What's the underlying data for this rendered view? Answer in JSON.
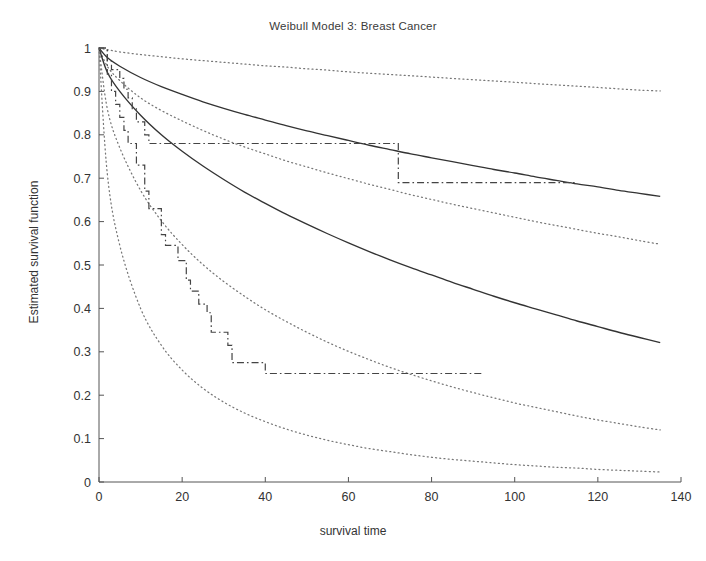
{
  "chart_data": {
    "type": "line",
    "title": "Weibull Model 3: Breast Cancer",
    "xlabel": "survival time",
    "ylabel": "Estimated survival function",
    "xlim": [
      0,
      140
    ],
    "ylim": [
      0,
      1
    ],
    "xticks": [
      0,
      20,
      40,
      60,
      80,
      100,
      120,
      140
    ],
    "yticks": [
      0,
      0.1,
      0.2,
      0.3,
      0.4,
      0.5,
      0.6,
      0.7,
      0.8,
      0.9,
      1
    ],
    "grid": false,
    "legend": "none",
    "colors": {
      "line": "#333333",
      "band": "#777777",
      "km": "#444444",
      "axis": "#555555"
    },
    "series": [
      {
        "name": "Fitted Weibull survival - group 1 (negative staining)",
        "style": "solid",
        "x": [
          0,
          2,
          5,
          10,
          15,
          20,
          25,
          30,
          35,
          40,
          45,
          50,
          55,
          60,
          65,
          70,
          75,
          80,
          85,
          90,
          95,
          100,
          105,
          110,
          115,
          120,
          125,
          130,
          135
        ],
        "y": [
          1.0,
          0.978,
          0.958,
          0.932,
          0.911,
          0.893,
          0.876,
          0.861,
          0.847,
          0.834,
          0.821,
          0.809,
          0.798,
          0.787,
          0.776,
          0.766,
          0.756,
          0.747,
          0.738,
          0.729,
          0.72,
          0.712,
          0.703,
          0.695,
          0.687,
          0.68,
          0.672,
          0.665,
          0.658
        ]
      },
      {
        "name": "Upper 95% confidence band - group 1",
        "style": "dotted",
        "x": [
          0,
          2,
          5,
          10,
          15,
          20,
          25,
          30,
          35,
          40,
          45,
          50,
          55,
          60,
          65,
          70,
          75,
          80,
          85,
          90,
          95,
          100,
          105,
          110,
          115,
          120,
          125,
          130,
          135
        ],
        "y": [
          1.0,
          0.996,
          0.991,
          0.985,
          0.98,
          0.975,
          0.971,
          0.967,
          0.963,
          0.959,
          0.956,
          0.952,
          0.949,
          0.945,
          0.942,
          0.939,
          0.936,
          0.933,
          0.93,
          0.927,
          0.924,
          0.921,
          0.918,
          0.915,
          0.912,
          0.909,
          0.906,
          0.903,
          0.901
        ]
      },
      {
        "name": "Lower 95% confidence band - group 1",
        "style": "dotted",
        "x": [
          0,
          2,
          5,
          10,
          15,
          20,
          25,
          30,
          35,
          40,
          45,
          50,
          55,
          60,
          65,
          70,
          75,
          80,
          85,
          90,
          95,
          100,
          105,
          110,
          115,
          120,
          125,
          130,
          135
        ],
        "y": [
          1.0,
          0.958,
          0.925,
          0.885,
          0.856,
          0.832,
          0.81,
          0.79,
          0.772,
          0.756,
          0.74,
          0.726,
          0.712,
          0.699,
          0.686,
          0.674,
          0.662,
          0.651,
          0.64,
          0.63,
          0.62,
          0.61,
          0.6,
          0.591,
          0.582,
          0.573,
          0.565,
          0.556,
          0.548
        ]
      },
      {
        "name": "Fitted Weibull survival - group 2 (positive staining)",
        "style": "solid",
        "x": [
          0,
          2,
          5,
          10,
          15,
          20,
          25,
          30,
          35,
          40,
          45,
          50,
          55,
          60,
          65,
          70,
          75,
          80,
          85,
          90,
          95,
          100,
          105,
          110,
          115,
          120,
          125,
          130,
          135
        ],
        "y": [
          1.0,
          0.944,
          0.9,
          0.845,
          0.8,
          0.762,
          0.728,
          0.697,
          0.668,
          0.642,
          0.617,
          0.594,
          0.572,
          0.551,
          0.531,
          0.512,
          0.494,
          0.477,
          0.46,
          0.444,
          0.428,
          0.413,
          0.399,
          0.385,
          0.371,
          0.358,
          0.345,
          0.333,
          0.321
        ]
      },
      {
        "name": "Lower 95% confidence band - group 2",
        "style": "dotted",
        "x": [
          0,
          2,
          5,
          10,
          15,
          20,
          25,
          30,
          35,
          40,
          45,
          50,
          55,
          60,
          65,
          70,
          75,
          80,
          85,
          90,
          95,
          100,
          105,
          110,
          115,
          120,
          125,
          130,
          135
        ],
        "y": [
          1.0,
          0.86,
          0.77,
          0.672,
          0.602,
          0.547,
          0.501,
          0.462,
          0.428,
          0.397,
          0.37,
          0.345,
          0.322,
          0.301,
          0.282,
          0.264,
          0.248,
          0.233,
          0.219,
          0.206,
          0.194,
          0.182,
          0.172,
          0.162,
          0.152,
          0.143,
          0.135,
          0.127,
          0.12
        ]
      },
      {
        "name": "Extreme lower confidence band",
        "style": "dotted",
        "x": [
          0,
          2,
          5,
          10,
          15,
          20,
          25,
          30,
          35,
          40,
          45,
          50,
          55,
          60,
          65,
          70,
          75,
          80,
          85,
          90,
          95,
          100,
          105,
          110,
          115,
          120,
          125,
          130,
          135
        ],
        "y": [
          1.0,
          0.71,
          0.545,
          0.4,
          0.315,
          0.258,
          0.216,
          0.184,
          0.159,
          0.139,
          0.122,
          0.108,
          0.096,
          0.086,
          0.077,
          0.07,
          0.063,
          0.057,
          0.052,
          0.048,
          0.044,
          0.04,
          0.037,
          0.034,
          0.032,
          0.029,
          0.027,
          0.025,
          0.023
        ]
      }
    ],
    "step_series": [
      {
        "name": "Kaplan-Meier estimate - group 1 (negative staining)",
        "style": "dashdot",
        "x": [
          0,
          1,
          2,
          3,
          5,
          6,
          7,
          8,
          9,
          11,
          12,
          71,
          72,
          115
        ],
        "y": [
          1.0,
          1.0,
          0.97,
          0.95,
          0.93,
          0.905,
          0.885,
          0.86,
          0.83,
          0.8,
          0.78,
          0.78,
          0.69,
          0.69
        ]
      },
      {
        "name": "Kaplan-Meier estimate - group 2 (positive staining)",
        "style": "dashdot",
        "x": [
          0,
          1,
          2,
          3,
          4,
          5,
          6,
          7,
          9,
          11,
          12,
          15,
          16,
          19,
          21,
          22,
          24,
          26,
          27,
          31,
          32,
          40,
          92
        ],
        "y": [
          1.0,
          1.0,
          0.94,
          0.9,
          0.87,
          0.84,
          0.81,
          0.78,
          0.73,
          0.67,
          0.63,
          0.57,
          0.545,
          0.51,
          0.465,
          0.44,
          0.41,
          0.39,
          0.345,
          0.315,
          0.275,
          0.25,
          0.25
        ]
      }
    ]
  }
}
